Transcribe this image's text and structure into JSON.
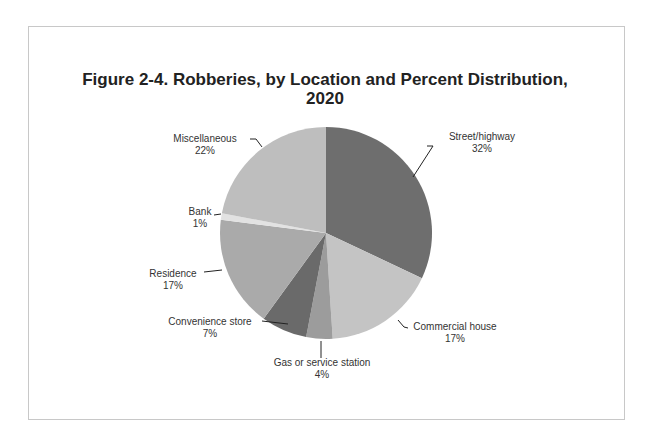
{
  "chart_data": {
    "type": "pie",
    "title": "Figure 2-4. Robberies, by Location and Percent Distribution, 2020",
    "title_lines": [
      "Figure 2-4. Robberies, by Location and Percent Distribution,",
      "2020"
    ],
    "categories": [
      "Street/highway",
      "Commercial house",
      "Gas or service station",
      "Convenience  store",
      "Residence",
      "Bank",
      "Miscellaneous"
    ],
    "values": [
      32,
      17,
      4,
      7,
      17,
      1,
      22
    ],
    "labels": [
      "32%",
      "17%",
      "4%",
      "7%",
      "17%",
      "1%",
      "22%"
    ],
    "colors": [
      "#6e6e6e",
      "#c4c4c4",
      "#9c9c9c",
      "#6a6a6a",
      "#aaaaaa",
      "#e2e2e2",
      "#bebebe"
    ],
    "legend": "none (leader-line data labels)"
  }
}
